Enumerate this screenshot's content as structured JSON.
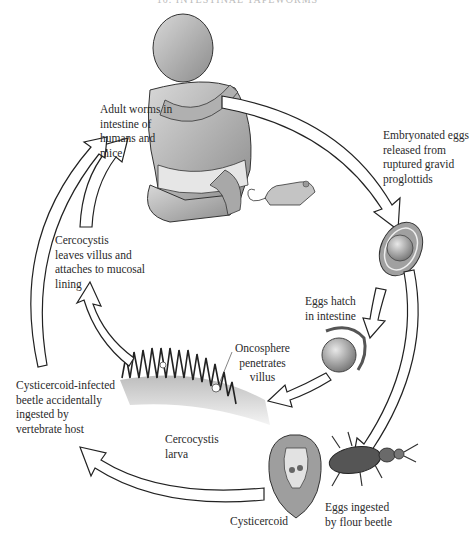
{
  "header": {
    "title": "10. INTESTINAL TAPEWORMS"
  },
  "diagram": {
    "labels": {
      "adult_worms": "Adult worms in\nintestine of\nhumans and\nmice",
      "embryonated_eggs": "Embryonated eggs\nreleased from\nruptured gravid\nproglottids",
      "cercocystis_leaves": "Cercocystis\nleaves villus and\nattaches to mucosal\nlining",
      "eggs_hatch": "Eggs hatch\nin intestine",
      "oncosphere": "Oncosphere\npenetrates\nvillus",
      "beetle_ingested": "Cysticercoid-infected\nbeetle accidentally\ningested by\nvertebrate host",
      "cercocystis_larva": "Cercocystis\nlarva",
      "cysticercoid": "Cysticercoid",
      "eggs_ingested": "Eggs ingested\nby flour beetle"
    },
    "figures": [
      "human-infant",
      "mouse",
      "embryonated-egg",
      "hatching-egg",
      "intestinal-villi",
      "cysticercoid",
      "flour-beetle"
    ],
    "colors": {
      "outline": "#1a1a1a",
      "fill_gray": "#9a9a9a",
      "arrow_fill": "#ffffff"
    }
  }
}
